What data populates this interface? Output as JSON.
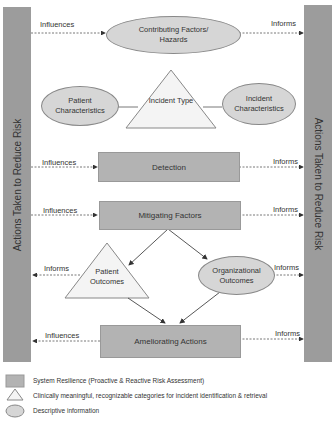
{
  "side_bars": {
    "left": "Actions Taken to Reduce Risk",
    "right": "Actions Taken to Reduce Risk"
  },
  "nodes": {
    "contributing_factors": "Contributing Factors/ Hazards",
    "patient_characteristics": "Patient Characteristics",
    "incident_type": "Incident Type",
    "incident_characteristics": "Incident Characteristics",
    "detection": "Detection",
    "mitigating_factors": "Mitigating Factors",
    "patient_outcomes": "Patient Outcomes",
    "organizational_outcomes": "Organizational Outcomes",
    "ameliorating_actions": "Ameliorating Actions"
  },
  "edge_labels": {
    "contrib_in": "Influences",
    "contrib_out": "Informs",
    "detection_in": "Influences",
    "detection_out": "Informs",
    "mitigating_in": "Influences",
    "mitigating_out": "Informs",
    "patient_outcomes_out": "Informs",
    "org_outcomes_out": "Informs",
    "ameliorating_left": "Influences",
    "ameliorating_right": "Informs"
  },
  "legend": [
    {
      "shape": "rectangle",
      "text": "System Resilience (Proactive & Reactive Risk Assessment)"
    },
    {
      "shape": "triangle",
      "text": "Clinically meaningful, recognizable categories for incident identification & retrieval"
    },
    {
      "shape": "ellipse",
      "text": "Descriptive information"
    }
  ],
  "colors": {
    "bar": "#9c9c9c",
    "rect": "#b3b3b3",
    "ellipse": "#d6d6d6",
    "triangle": "#f4f4f4"
  }
}
